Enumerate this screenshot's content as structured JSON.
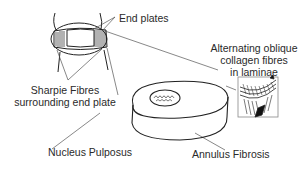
{
  "diagram": {
    "labels": {
      "end_plates": "End plates",
      "sharpie_fibres_line1": "Sharpie Fibres",
      "sharpie_fibres_line2": "surrounding end plate",
      "collagen_line1": "Alternating oblique",
      "collagen_line2": "collagen fibres",
      "collagen_line3": "in laminae",
      "nucleus": "Nucleus Pulposus",
      "annulus": "Annulus Fibrosis"
    },
    "colors": {
      "line": "#222222",
      "pointer": "#777777",
      "background": "#ffffff"
    }
  }
}
